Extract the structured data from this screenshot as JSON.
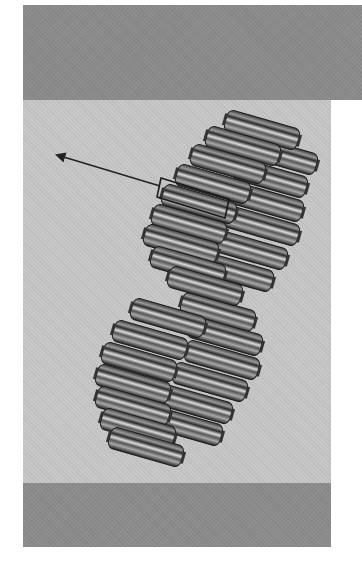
{
  "figure": {
    "colors": {
      "band_dark": "#8b8b8b",
      "panel_light": "#c6c6c6",
      "disc_dark": "#2a2a2a",
      "disc_mid": "#6a6a6a",
      "disc_light": "#d8d8d8",
      "arrow": "#222222"
    },
    "callout": {
      "box_label": "",
      "arrow_direction": "upper-left"
    },
    "discs_upper": [
      [
        262,
        130
      ],
      [
        243,
        146
      ],
      [
        228,
        164
      ],
      [
        213,
        184
      ],
      [
        199,
        204
      ],
      [
        189,
        224
      ],
      [
        181,
        244
      ],
      [
        188,
        266
      ],
      [
        205,
        286
      ]
    ],
    "discs_upper_right": [
      [
        280,
        155
      ],
      [
        270,
        178
      ],
      [
        266,
        202
      ],
      [
        262,
        226
      ],
      [
        250,
        250
      ],
      [
        236,
        272
      ]
    ],
    "discs_lower": [
      [
        168,
        318
      ],
      [
        150,
        340
      ],
      [
        139,
        362
      ],
      [
        133,
        384
      ],
      [
        133,
        406
      ],
      [
        138,
        428
      ],
      [
        146,
        447
      ]
    ],
    "discs_lower_right": [
      [
        218,
        312
      ],
      [
        225,
        336
      ],
      [
        222,
        360
      ],
      [
        210,
        382
      ],
      [
        195,
        404
      ],
      [
        185,
        426
      ]
    ]
  }
}
